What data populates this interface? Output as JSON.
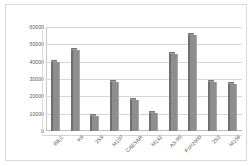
{
  "chart_data": {
    "type": "bar",
    "title": "",
    "subtitle": "",
    "xlabel": "",
    "ylabel": "",
    "categories": [
      "99LC",
      "K9",
      "2S9",
      "M107",
      "CAESAR",
      "M142",
      "AS-90",
      "PzH2000",
      "2S3",
      "M109"
    ],
    "values": [
      40000,
      47000,
      8500,
      28500,
      18000,
      10500,
      44500,
      55500,
      28000,
      27000
    ],
    "ylim": [
      0,
      60000
    ],
    "ytick_labels": [
      "60000",
      "50000",
      "40000",
      "30000",
      "20000",
      "10000",
      "0"
    ],
    "ytick_values": [
      60000,
      50000,
      40000,
      30000,
      20000,
      10000,
      0
    ],
    "grid": true,
    "grid_axis": "y",
    "legend": false,
    "legend_position": "none",
    "series": [
      {
        "name": "Series 1",
        "values": [
          40000,
          47000,
          8500,
          28500,
          18000,
          10500,
          44500,
          55500,
          28000,
          27000
        ],
        "color": "#8e8e8e"
      }
    ],
    "colors": {
      "bar_face": "#8e8e8e",
      "bar_shadow": "#6f6f6f",
      "bar_highlight": "#a8a8a8",
      "gridline": "#d6d6d6",
      "axis": "#bdbdbd",
      "text": "#5a5a5a",
      "frame": "#d9d9d9",
      "background": "#ffffff"
    }
  }
}
